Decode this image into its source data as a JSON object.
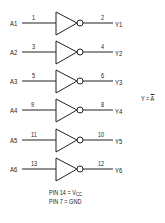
{
  "diagram": {
    "gates": [
      {
        "input": "A1",
        "input_pin": "1",
        "output": "Y1",
        "output_pin": "2",
        "y": 23
      },
      {
        "input": "A2",
        "input_pin": "3",
        "output": "Y2",
        "output_pin": "4",
        "y": 52
      },
      {
        "input": "A3",
        "input_pin": "5",
        "output": "Y3",
        "output_pin": "6",
        "y": 81
      },
      {
        "input": "A4",
        "input_pin": "9",
        "output": "Y4",
        "output_pin": "8",
        "y": 110
      },
      {
        "input": "A5",
        "input_pin": "11",
        "output": "Y5",
        "output_pin": "10",
        "y": 140
      },
      {
        "input": "A6",
        "input_pin": "13",
        "output": "Y6",
        "output_pin": "12",
        "y": 169
      }
    ],
    "equation": {
      "lhs": "Y = ",
      "rhs": "A"
    },
    "power": {
      "vcc_prefix": "PIN 14 = V",
      "vcc_sub": "CC",
      "gnd": "PIN 7 = GND"
    }
  }
}
